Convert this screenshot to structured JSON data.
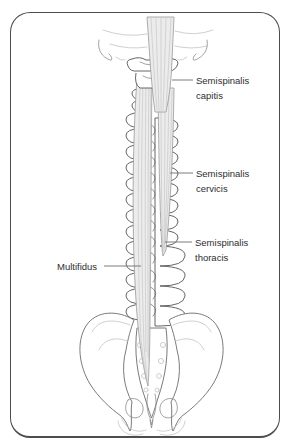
{
  "figure": {
    "labels": {
      "semispinalis_capitis": "Semispinalis capitis",
      "semispinalis_cervicis": "Semispinalis cervicis",
      "semispinalis_thoracis": "Semispinalis thoracis",
      "multifidus": "Multifidus"
    },
    "colors": {
      "background": "#ffffff",
      "frame_border": "#4d4d4d",
      "bone_outline": "#555555",
      "muscle_fill": "#ececec",
      "muscle_fiber": "#bdbdbd",
      "light_detail": "#c3c3c3",
      "leader_line": "#6e6e6e",
      "label_text": "#2e2e2e"
    }
  }
}
